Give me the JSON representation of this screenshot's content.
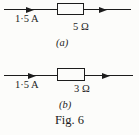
{
  "figure": {
    "caption": "Fig. 6",
    "ink_color": "#1c1c1c",
    "background_color": "#fcfcfa",
    "circuits": [
      {
        "current_label": "1·5 A",
        "resistor_label": "5 Ω",
        "sub_label": "(a)"
      },
      {
        "current_label": "1·5 A",
        "resistor_label": "3 Ω",
        "sub_label": "(b)"
      }
    ]
  }
}
